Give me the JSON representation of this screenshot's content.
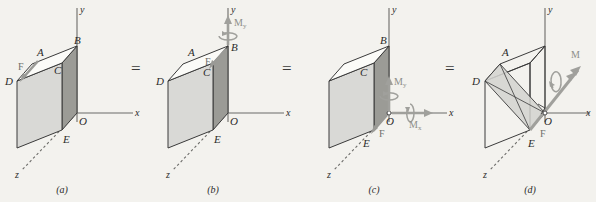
{
  "figure": {
    "background_color": "#f3f2ee",
    "operators": [
      "=",
      "=",
      "="
    ],
    "panels": [
      {
        "caption": "(a)",
        "axes": {
          "x": "x",
          "y": "y",
          "z": "z",
          "origin": "O"
        },
        "vertices": [
          "A",
          "B",
          "C",
          "D",
          "E",
          "O"
        ],
        "force_label": "F",
        "moments": []
      },
      {
        "caption": "(b)",
        "axes": {
          "x": "x",
          "y": "y",
          "z": "z",
          "origin": "O"
        },
        "vertices": [
          "A",
          "B",
          "C",
          "D",
          "E",
          "O"
        ],
        "force_label": "F",
        "moments": [
          {
            "symbol": "M",
            "subscript": "y"
          }
        ]
      },
      {
        "caption": "(c)",
        "axes": {
          "x": "x",
          "y": "y",
          "z": "z",
          "origin": "O"
        },
        "vertices": [
          "B",
          "C",
          "E",
          "O"
        ],
        "force_label": "F",
        "moments": [
          {
            "symbol": "M",
            "subscript": "y"
          },
          {
            "symbol": "M",
            "subscript": "x"
          }
        ]
      },
      {
        "caption": "(d)",
        "axes": {
          "x": "x",
          "y": "y",
          "z": "z",
          "origin": "O"
        },
        "vertices": [
          "A",
          "D",
          "E",
          "O"
        ],
        "force_label": "F",
        "moments": [
          {
            "symbol": "M",
            "subscript": ""
          }
        ]
      }
    ],
    "colors": {
      "face_light": "#d9d9d6",
      "face_dark": "#9b9b96",
      "face_top": "#fbfbf8",
      "edge": "#3a3a3a",
      "axis": "#6b6b68",
      "force_arrow": "#9a9a96",
      "moment_arrow": "#a0a09c",
      "label": "#2b2b2b"
    }
  }
}
